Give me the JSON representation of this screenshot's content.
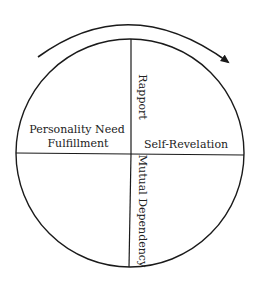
{
  "diagram": {
    "type": "circle-quadrant-cycle",
    "stroke_color": "#1a1a1a",
    "arrow": {
      "direction": "clockwise",
      "icon": "curved-arrow-icon"
    },
    "quadrants": {
      "upper_left": {
        "label_line1": "Personality Need",
        "label_line2": "Fulfillment"
      },
      "upper_divider": {
        "label": "Rapport"
      },
      "upper_right": {
        "label": "Self-Revelation"
      },
      "lower_divider": {
        "label": "Mutual Dependency"
      }
    }
  }
}
